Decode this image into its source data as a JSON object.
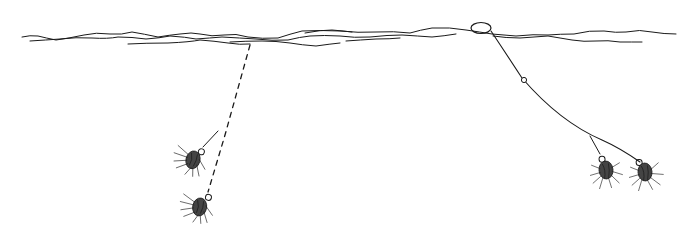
{
  "illustration": {
    "subject": "fly fishing rig diagram: two nymph setups under water surface",
    "colors": {
      "ink": "#1a1a1a",
      "background": "#ffffff",
      "hackle": "#888888"
    },
    "left_rig": {
      "line_style": "dashed",
      "flies": 2
    },
    "right_rig": {
      "line_style": "solid",
      "indicator": "strike-indicator",
      "flies": 2
    }
  }
}
